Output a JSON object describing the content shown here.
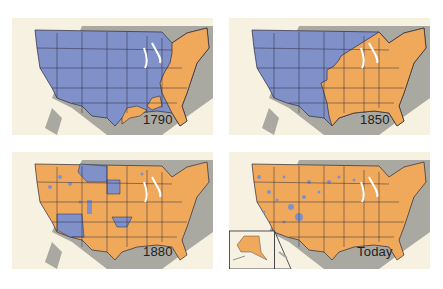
{
  "figure": {
    "title": "",
    "legend": {
      "settled": {
        "color": "#f0a95b",
        "meaning": "settled area"
      },
      "unsettled": {
        "color": "#8090c9",
        "meaning": "unsettled area"
      }
    },
    "colors": {
      "background": "#f6f1e1",
      "land_outside": "#a9a8a1",
      "water": "#ffffff",
      "borders": "#2b2b3a"
    },
    "panels": [
      {
        "id": "p1",
        "year_label": "1790",
        "settled_fraction": 0.18,
        "settled_region": "Atlantic seaboard and Louisiana/Gulf coast area"
      },
      {
        "id": "p2",
        "year_label": "1850",
        "settled_fraction": 0.5,
        "settled_region": "East of roughly the 96th meridian plus east Texas"
      },
      {
        "id": "p3",
        "year_label": "1880",
        "settled_fraction": 0.85,
        "settled_region": "Most of country; unsettled in Arizona/New Mexico, Oklahoma, Dakotas/Montana, scattered West"
      },
      {
        "id": "p4",
        "year_label": "Today",
        "settled_fraction": 0.97,
        "settled_region": "Nearly all; small unsettled patches in West; Alaska & Hawaii inset"
      }
    ]
  }
}
